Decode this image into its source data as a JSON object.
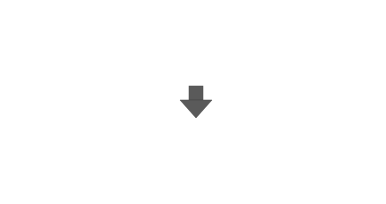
{
  "chart_data": [
    {
      "type": "stem",
      "title": "",
      "xlabel": "",
      "ylabel": "",
      "xlim": [
        0,
        7
      ],
      "ylim": [
        -3,
        2
      ],
      "x": [
        0,
        1,
        2,
        3,
        4,
        5,
        6,
        7
      ],
      "values": [
        0.8,
        1.2,
        -0.7,
        0.7,
        0.7,
        -2.7,
        -0.7,
        0.8
      ],
      "xticks": [
        "0",
        "1",
        "2",
        "3",
        "4",
        "5",
        "6",
        "7"
      ],
      "yticks": [
        "2",
        "1",
        "0",
        "-1",
        "-2",
        "-3"
      ],
      "grid": false
    },
    {
      "type": "stem",
      "title": "",
      "xlabel": "",
      "ylabel": "",
      "xlim": [
        0,
        15
      ],
      "ylim": [
        0,
        3
      ],
      "x": [
        0,
        1,
        2,
        3,
        4,
        5,
        6,
        7,
        8,
        9,
        10,
        11,
        12,
        13,
        14,
        15
      ],
      "values": [
        0.8,
        1.3,
        0,
        0.7,
        0.7,
        0,
        0,
        0.7,
        0,
        0,
        0.7,
        0,
        0,
        2.7,
        0.7,
        0
      ],
      "xticks": [
        "0",
        "5",
        "10",
        "15"
      ],
      "yticks": [
        "3",
        "2",
        "1",
        "0"
      ],
      "annotations": [
        {
          "text": "+",
          "region": "left"
        },
        {
          "text": "-",
          "region": "right"
        }
      ],
      "divider_x": 7.5,
      "grid": false
    }
  ],
  "arrow": {
    "direction": "down",
    "color": "#555555"
  },
  "labels": {
    "plus": "+",
    "minus": "-"
  }
}
